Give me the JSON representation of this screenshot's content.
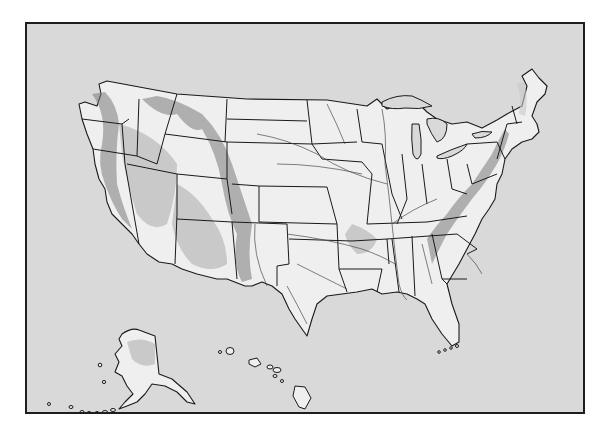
{
  "map": {
    "type": "outline-relief-map",
    "subject": "United States",
    "labels": [],
    "regions": [
      "contiguous-us",
      "alaska",
      "hawaii"
    ],
    "features": [
      "state-borders",
      "rivers",
      "mountain-relief-shading",
      "great-lakes",
      "florida-keys"
    ],
    "colors": {
      "background": "#d9d9d9",
      "land": "#efefef",
      "border": "#1a1a1a",
      "river": "#4a4a4a",
      "relief": "#7a7a7a"
    }
  }
}
